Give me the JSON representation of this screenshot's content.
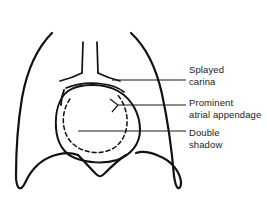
{
  "figure": {
    "background_color": "#ffffff",
    "line_color": "#111111"
  },
  "annotations": [
    {
      "id": "splayed-carina",
      "line1": "Splayed",
      "line2": "carina",
      "leader_y": 80,
      "leader_x_start": 112,
      "leader_x_end": 186
    },
    {
      "id": "prominent-atrial-appendage",
      "line1": "Prominent",
      "line2": "atrial appendage",
      "leader_y": 105,
      "leader_x_start": 118,
      "leader_x_end": 186
    },
    {
      "id": "double-shadow",
      "line1": "Double",
      "line2": "shadow",
      "leader_y": 131,
      "leader_x_start": 78,
      "leader_x_end": 186
    }
  ],
  "anatomy": {
    "left_lung_label": "left lung field outline",
    "right_lung_label": "right lung field outline",
    "trachea_label": "trachea",
    "carina_label": "splayed carina with main bronchi",
    "heart_label": "enlarged cardiac silhouette",
    "atrial_appendage_label": "prominent left atrial appendage bulge",
    "double_shadow_label": "double shadow of enlarged left atrium",
    "diaphragm_label": "hemidiaphragm domes"
  }
}
